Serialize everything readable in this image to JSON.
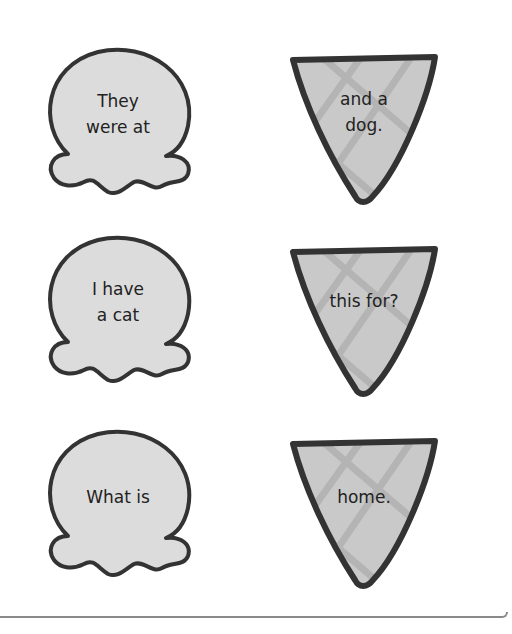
{
  "colors": {
    "stroke": "#333333",
    "scoop_fill": "#dcdcdc",
    "cone_fill": "#c9c9c9",
    "cone_lattice": "#b4b4b4",
    "text": "#222222",
    "frame": "#8a8a8a"
  },
  "pairs": [
    {
      "scoop": {
        "icon": "ice-cream-scoop-icon",
        "line1": "They",
        "line2": "were at"
      },
      "cone": {
        "icon": "ice-cream-cone-icon",
        "line1": "and a",
        "line2": "dog."
      }
    },
    {
      "scoop": {
        "icon": "ice-cream-scoop-icon",
        "line1": "I have",
        "line2": "a cat"
      },
      "cone": {
        "icon": "ice-cream-cone-icon",
        "line1": "this for?",
        "line2": ""
      }
    },
    {
      "scoop": {
        "icon": "ice-cream-scoop-icon",
        "line1": "What is",
        "line2": ""
      },
      "cone": {
        "icon": "ice-cream-cone-icon",
        "line1": "home.",
        "line2": ""
      }
    }
  ]
}
